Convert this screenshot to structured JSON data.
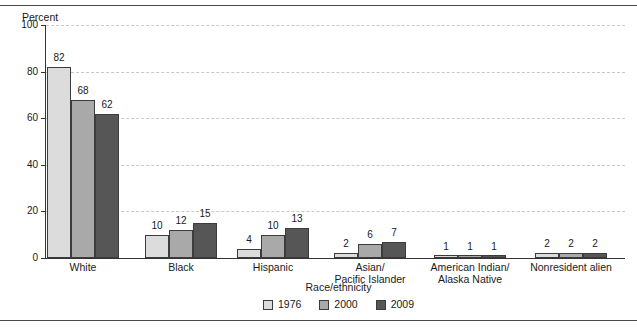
{
  "chart_data": {
    "type": "bar",
    "title": "",
    "subtitle": "",
    "xlabel": "Race/ethnicity",
    "ylabel": "Percent",
    "ylim": [
      0,
      100
    ],
    "yticks": [
      0,
      20,
      40,
      60,
      80,
      100
    ],
    "ytick_labels": [
      "0",
      "20",
      "40",
      "60",
      "80",
      "100"
    ],
    "grid": "horizontal-dashed",
    "legend_position": "bottom-center",
    "categories": [
      "White",
      "Black",
      "Hispanic",
      "Asian/\nPacific Islander",
      "American Indian/\nAlaska Native",
      "Nonresident alien"
    ],
    "category_lines": [
      [
        "White"
      ],
      [
        "Black"
      ],
      [
        "Hispanic"
      ],
      [
        "Asian/",
        "Pacific Islander"
      ],
      [
        "American Indian/",
        "Alaska Native"
      ],
      [
        "Nonresident alien"
      ]
    ],
    "series": [
      {
        "name": "1976",
        "color": "#dcdcdc",
        "values": [
          82,
          10,
          4,
          2,
          1,
          2
        ]
      },
      {
        "name": "2000",
        "color": "#a9a9a9",
        "values": [
          68,
          12,
          10,
          6,
          1,
          2
        ]
      },
      {
        "name": "2009",
        "color": "#565656",
        "values": [
          62,
          15,
          13,
          7,
          1,
          2
        ]
      }
    ]
  },
  "legend": {
    "items": [
      {
        "label": "1976"
      },
      {
        "label": "2000"
      },
      {
        "label": "2009"
      }
    ]
  },
  "colors": {
    "series_1976": "#dcdcdc",
    "series_2000": "#a9a9a9",
    "series_2009": "#565656",
    "axis": "#333333",
    "gridline": "#c9c9c9",
    "rule": "#4a4a4a"
  }
}
